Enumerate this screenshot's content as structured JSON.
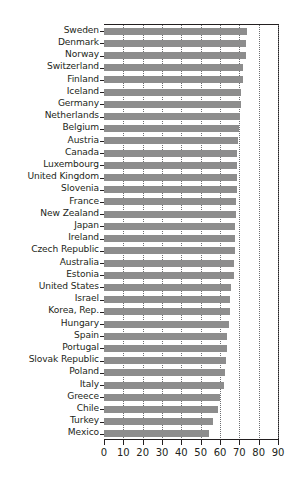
{
  "chart_data": {
    "type": "bar",
    "orientation": "horizontal",
    "title": "",
    "subtitle": "",
    "xlabel": "",
    "ylabel": "",
    "xlim": [
      0,
      90
    ],
    "xticks": [
      0,
      10,
      20,
      30,
      40,
      50,
      60,
      70,
      80,
      90
    ],
    "xticklabels": [
      "0",
      "10",
      "20",
      "30",
      "40",
      "50",
      "60",
      "70",
      "80",
      "90"
    ],
    "grid": "vertical-dotted",
    "legend": null,
    "bar_color": "#8d8d8d",
    "axis_color": "#231f20",
    "gridline_color": "#6d6e71",
    "categories": [
      "Sweden",
      "Denmark",
      "Norway",
      "Switzerland",
      "Finland",
      "Iceland",
      "Germany",
      "Netherlands",
      "Belgium",
      "Austria",
      "Canada",
      "Luxembourg",
      "United Kingdom",
      "Slovenia",
      "France",
      "New Zealand",
      "Japan",
      "Ireland",
      "Czech Republic",
      "Australia",
      "Estonia",
      "United States",
      "Israel",
      "Korea, Rep.",
      "Hungary",
      "Spain",
      "Portugal",
      "Slovak Republic",
      "Poland",
      "Italy",
      "Greece",
      "Chile",
      "Turkey",
      "Mexico"
    ],
    "values": [
      74.0,
      73.5,
      73.3,
      72.0,
      71.7,
      71.0,
      70.8,
      70.5,
      69.8,
      69.3,
      69.0,
      68.8,
      68.7,
      68.6,
      68.5,
      68.3,
      68.0,
      67.9,
      67.8,
      67.4,
      67.2,
      65.6,
      65.3,
      65.2,
      64.4,
      63.6,
      63.5,
      63.2,
      62.4,
      62.2,
      60.2,
      59.0,
      56.6,
      54.3
    ]
  }
}
